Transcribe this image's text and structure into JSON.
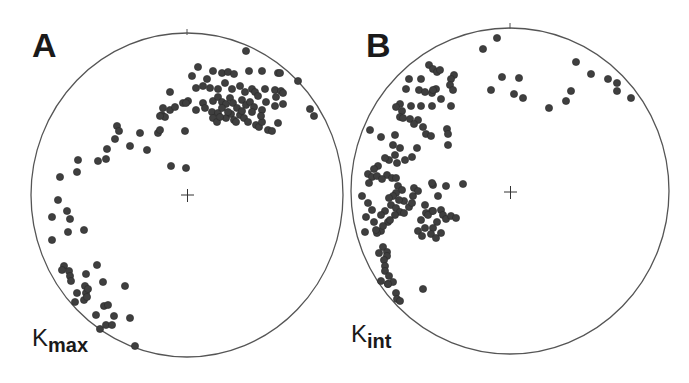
{
  "chart_data": [
    {
      "type": "scatter",
      "title": "A",
      "projection": "stereonet (lower hemisphere, equal-area)",
      "label": "K",
      "label_sub": "max",
      "center_px": [
        187,
        195
      ],
      "radius_px": [
        156,
        162
      ],
      "dot_color": "#3f3f3f",
      "points_px": [
        [
          246,
          51
        ],
        [
          198,
          67
        ],
        [
          192,
          76
        ],
        [
          213,
          71
        ],
        [
          222,
          73
        ],
        [
          228,
          72
        ],
        [
          234,
          74
        ],
        [
          249,
          71
        ],
        [
          262,
          71
        ],
        [
          278,
          73
        ],
        [
          280,
          73
        ],
        [
          298,
          81
        ],
        [
          196,
          88
        ],
        [
          203,
          86
        ],
        [
          207,
          79
        ],
        [
          210,
          88
        ],
        [
          218,
          89
        ],
        [
          225,
          83
        ],
        [
          232,
          89
        ],
        [
          240,
          86
        ],
        [
          245,
          92
        ],
        [
          252,
          89
        ],
        [
          255,
          92
        ],
        [
          265,
          89
        ],
        [
          275,
          90
        ],
        [
          281,
          91
        ],
        [
          276,
          97
        ],
        [
          283,
          93
        ],
        [
          170,
          92
        ],
        [
          188,
          101
        ],
        [
          183,
          103
        ],
        [
          203,
          103
        ],
        [
          213,
          101
        ],
        [
          218,
          97
        ],
        [
          222,
          102
        ],
        [
          226,
          104
        ],
        [
          230,
          98
        ],
        [
          233,
          103
        ],
        [
          237,
          108
        ],
        [
          242,
          100
        ],
        [
          246,
          105
        ],
        [
          250,
          102
        ],
        [
          254,
          107
        ],
        [
          258,
          96
        ],
        [
          262,
          110
        ],
        [
          266,
          102
        ],
        [
          275,
          106
        ],
        [
          283,
          104
        ],
        [
          163,
          108
        ],
        [
          170,
          110
        ],
        [
          175,
          107
        ],
        [
          186,
          103
        ],
        [
          196,
          110
        ],
        [
          205,
          108
        ],
        [
          212,
          112
        ],
        [
          218,
          113
        ],
        [
          222,
          108
        ],
        [
          226,
          118
        ],
        [
          231,
          114
        ],
        [
          234,
          120
        ],
        [
          240,
          115
        ],
        [
          244,
          118
        ],
        [
          248,
          122
        ],
        [
          252,
          112
        ],
        [
          256,
          125
        ],
        [
          259,
          127
        ],
        [
          262,
          122
        ],
        [
          268,
          130
        ],
        [
          272,
          131
        ],
        [
          278,
          123
        ],
        [
          162,
          115
        ],
        [
          165,
          117
        ],
        [
          160,
          116
        ],
        [
          213,
          118
        ],
        [
          217,
          122
        ],
        [
          220,
          117
        ],
        [
          228,
          112
        ],
        [
          236,
          122
        ],
        [
          242,
          111
        ],
        [
          261,
          116
        ],
        [
          310,
          109
        ],
        [
          314,
          116
        ],
        [
          117,
          126
        ],
        [
          119,
          131
        ],
        [
          115,
          139
        ],
        [
          140,
          133
        ],
        [
          130,
          146
        ],
        [
          147,
          150
        ],
        [
          158,
          133
        ],
        [
          160,
          130
        ],
        [
          185,
          131
        ],
        [
          171,
          166
        ],
        [
          186,
          168
        ],
        [
          107,
          149
        ],
        [
          98,
          161
        ],
        [
          106,
          159
        ],
        [
          78,
          160
        ],
        [
          77,
          172
        ],
        [
          60,
          177
        ],
        [
          58,
          200
        ],
        [
          52,
          217
        ],
        [
          67,
          211
        ],
        [
          70,
          219
        ],
        [
          68,
          232
        ],
        [
          84,
          230
        ],
        [
          52,
          240
        ],
        [
          64,
          266
        ],
        [
          62,
          270
        ],
        [
          69,
          271
        ],
        [
          70,
          276
        ],
        [
          71,
          281
        ],
        [
          86,
          274
        ],
        [
          97,
          265
        ],
        [
          85,
          286
        ],
        [
          77,
          293
        ],
        [
          86,
          293
        ],
        [
          88,
          289
        ],
        [
          103,
          282
        ],
        [
          75,
          302
        ],
        [
          84,
          300
        ],
        [
          87,
          297
        ],
        [
          104,
          306
        ],
        [
          125,
          286
        ],
        [
          96,
          315
        ],
        [
          108,
          305
        ],
        [
          114,
          316
        ],
        [
          100,
          329
        ],
        [
          106,
          325
        ],
        [
          112,
          325
        ],
        [
          130,
          318
        ],
        [
          135,
          346
        ]
      ]
    },
    {
      "type": "scatter",
      "title": "B",
      "projection": "stereonet (lower hemisphere, equal-area)",
      "label": "K",
      "label_sub": "int",
      "center_px": [
        510,
        192
      ],
      "radius_px": [
        159,
        163
      ],
      "dot_color": "#3f3f3f",
      "points_px": [
        [
          497,
          38
        ],
        [
          483,
          49
        ],
        [
          576,
          62
        ],
        [
          591,
          74
        ],
        [
          608,
          79
        ],
        [
          617,
          83
        ],
        [
          617,
          91
        ],
        [
          631,
          98
        ],
        [
          571,
          91
        ],
        [
          566,
          101
        ],
        [
          549,
          108
        ],
        [
          502,
          77
        ],
        [
          519,
          78
        ],
        [
          491,
          90
        ],
        [
          514,
          94
        ],
        [
          523,
          98
        ],
        [
          429,
          65
        ],
        [
          433,
          69
        ],
        [
          437,
          72
        ],
        [
          440,
          70
        ],
        [
          454,
          75
        ],
        [
          451,
          79
        ],
        [
          450,
          85
        ],
        [
          453,
          90
        ],
        [
          436,
          89
        ],
        [
          432,
          93
        ],
        [
          421,
          79
        ],
        [
          432,
          106
        ],
        [
          451,
          106
        ],
        [
          409,
          79
        ],
        [
          406,
          89
        ],
        [
          419,
          90
        ],
        [
          433,
          90
        ],
        [
          425,
          92
        ],
        [
          441,
          99
        ],
        [
          400,
          104
        ],
        [
          396,
          107
        ],
        [
          402,
          111
        ],
        [
          411,
          106
        ],
        [
          421,
          106
        ],
        [
          400,
          117
        ],
        [
          403,
          118
        ],
        [
          410,
          119
        ],
        [
          418,
          120
        ],
        [
          414,
          124
        ],
        [
          423,
          127
        ],
        [
          426,
          134
        ],
        [
          431,
          136
        ],
        [
          447,
          129
        ],
        [
          448,
          134
        ],
        [
          448,
          145
        ],
        [
          370,
          130
        ],
        [
          381,
          137
        ],
        [
          395,
          135
        ],
        [
          393,
          145
        ],
        [
          400,
          148
        ],
        [
          395,
          155
        ],
        [
          389,
          160
        ],
        [
          397,
          163
        ],
        [
          405,
          160
        ],
        [
          412,
          157
        ],
        [
          417,
          148
        ],
        [
          387,
          175
        ],
        [
          392,
          178
        ],
        [
          385,
          158
        ],
        [
          378,
          166
        ],
        [
          374,
          169
        ],
        [
          368,
          174
        ],
        [
          372,
          177
        ],
        [
          377,
          176
        ],
        [
          382,
          179
        ],
        [
          369,
          183
        ],
        [
          396,
          178
        ],
        [
          398,
          186
        ],
        [
          402,
          190
        ],
        [
          396,
          193
        ],
        [
          393,
          196
        ],
        [
          389,
          198
        ],
        [
          391,
          205
        ],
        [
          396,
          208
        ],
        [
          400,
          212
        ],
        [
          404,
          213
        ],
        [
          409,
          207
        ],
        [
          404,
          201
        ],
        [
          412,
          203
        ],
        [
          413,
          196
        ],
        [
          414,
          188
        ],
        [
          399,
          200
        ],
        [
          395,
          215
        ],
        [
          385,
          211
        ],
        [
          381,
          215
        ],
        [
          388,
          222
        ],
        [
          390,
          220
        ],
        [
          418,
          191
        ],
        [
          433,
          185
        ],
        [
          432,
          183
        ],
        [
          438,
          196
        ],
        [
          425,
          205
        ],
        [
          432,
          211
        ],
        [
          446,
          186
        ],
        [
          463,
          184
        ],
        [
          362,
          196
        ],
        [
          368,
          203
        ],
        [
          372,
          210
        ],
        [
          366,
          217
        ],
        [
          374,
          222
        ],
        [
          381,
          231
        ],
        [
          383,
          226
        ],
        [
          377,
          233
        ],
        [
          426,
          213
        ],
        [
          421,
          220
        ],
        [
          428,
          215
        ],
        [
          433,
          211
        ],
        [
          441,
          210
        ],
        [
          443,
          215
        ],
        [
          446,
          219
        ],
        [
          451,
          216
        ],
        [
          456,
          218
        ],
        [
          437,
          222
        ],
        [
          433,
          228
        ],
        [
          431,
          234
        ],
        [
          436,
          238
        ],
        [
          441,
          233
        ],
        [
          425,
          228
        ],
        [
          418,
          231
        ],
        [
          422,
          236
        ],
        [
          365,
          232
        ],
        [
          376,
          230
        ],
        [
          383,
          247
        ],
        [
          387,
          252
        ],
        [
          379,
          253
        ],
        [
          387,
          256
        ],
        [
          384,
          260
        ],
        [
          385,
          266
        ],
        [
          385,
          271
        ],
        [
          389,
          276
        ],
        [
          381,
          281
        ],
        [
          388,
          284
        ],
        [
          393,
          282
        ],
        [
          396,
          293
        ],
        [
          388,
          284
        ],
        [
          423,
          289
        ],
        [
          397,
          299
        ],
        [
          400,
          301
        ]
      ]
    }
  ],
  "panels": [
    {
      "letter": "A",
      "label": "K",
      "label_sub": "max"
    },
    {
      "letter": "B",
      "label": "K",
      "label_sub": "int"
    }
  ]
}
